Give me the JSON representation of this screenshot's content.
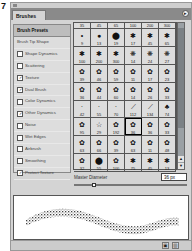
{
  "figure_number": "7",
  "panel": {
    "tab_label": "Brushes",
    "menu_icon": "flyout-menu-icon"
  },
  "left_list": {
    "header": "Brush Presets",
    "items": [
      {
        "label": "Brush Tip Shape",
        "has_checkbox": false,
        "checked": false
      },
      {
        "label": "Shape Dynamics",
        "has_checkbox": true,
        "checked": false
      },
      {
        "label": "Scattering",
        "has_checkbox": true,
        "checked": false
      },
      {
        "label": "Texture",
        "has_checkbox": true,
        "checked": true
      },
      {
        "label": "Dual Brush",
        "has_checkbox": true,
        "checked": true
      },
      {
        "label": "Color Dynamics",
        "has_checkbox": true,
        "checked": false
      },
      {
        "label": "Other Dynamics",
        "has_checkbox": true,
        "checked": true
      },
      {
        "label": "Noise",
        "has_checkbox": true,
        "checked": false
      },
      {
        "label": "Wet Edges",
        "has_checkbox": true,
        "checked": false
      },
      {
        "label": "Airbrush",
        "has_checkbox": true,
        "checked": false
      },
      {
        "label": "Smoothing",
        "has_checkbox": true,
        "checked": false
      },
      {
        "label": "Protect Texture",
        "has_checkbox": true,
        "checked": true
      }
    ]
  },
  "grid": {
    "header_row": [
      "35",
      "45",
      "65",
      "100",
      "200",
      "300"
    ],
    "rows": [
      [
        "9",
        "13",
        "19",
        "17",
        "45",
        "65"
      ],
      [
        "100",
        "200",
        "300",
        "14",
        "24",
        "27"
      ],
      [
        "39",
        "46",
        "59",
        "11",
        "17",
        "23"
      ],
      [
        "36",
        "44",
        "60",
        "14",
        "26",
        "33"
      ],
      [
        "42",
        "55",
        "70",
        "112",
        "134",
        "74"
      ],
      [
        "95",
        "29",
        "192",
        "36",
        "36",
        "33"
      ],
      [
        "63",
        "66",
        "39",
        "63",
        "11",
        "48"
      ],
      [
        "32",
        "55",
        "100",
        "75",
        "45",
        "13"
      ]
    ],
    "selected": {
      "row": 5,
      "col": 3
    }
  },
  "master_diameter": {
    "label": "Master Diameter",
    "value": "36 px",
    "slider_percent": 16
  },
  "footer": {
    "new_icon": "new-preset-icon",
    "delete_icon": "trash-icon"
  }
}
